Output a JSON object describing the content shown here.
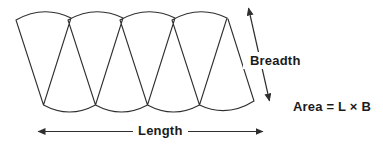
{
  "figure": {
    "type": "diagram",
    "cone_count": 4,
    "labels": {
      "breadth": "Breadth",
      "length": "Length",
      "area_formula": "Area = L × B"
    },
    "colors": {
      "stroke": "#2f2f2f",
      "text": "#1b1b1b",
      "background": "#ffffff"
    }
  }
}
